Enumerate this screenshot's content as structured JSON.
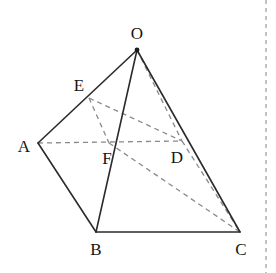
{
  "figure": {
    "background_color": "#ffffff",
    "solid_stroke_color": "#2b2b2b",
    "dashed_stroke_color": "#8a8a8a",
    "label_color": "#141414"
  },
  "vertices": [
    {
      "name": "O",
      "label": "O",
      "x": 137,
      "y": 50,
      "label_x": 137,
      "label_y": 33,
      "dot": true
    },
    {
      "name": "E",
      "label": "E",
      "x": 89,
      "y": 98,
      "label_x": 79,
      "label_y": 85,
      "dot": false
    },
    {
      "name": "A",
      "label": "A",
      "x": 38,
      "y": 143,
      "label_x": 24,
      "label_y": 146,
      "dot": false
    },
    {
      "name": "F",
      "label": "F",
      "x": 109,
      "y": 143,
      "label_x": 107,
      "label_y": 158,
      "dot": false
    },
    {
      "name": "D",
      "label": "D",
      "x": 182,
      "y": 141,
      "label_x": 177,
      "label_y": 157,
      "dot": false
    },
    {
      "name": "B",
      "label": "B",
      "x": 96,
      "y": 232,
      "label_x": 96,
      "label_y": 249,
      "dot": false
    },
    {
      "name": "C",
      "label": "C",
      "x": 240,
      "y": 232,
      "label_x": 241,
      "label_y": 249,
      "dot": false
    }
  ],
  "edges_solid": [
    {
      "name": "edge-O-A",
      "from": "O",
      "to": "A"
    },
    {
      "name": "edge-O-B",
      "from": "O",
      "to": "B"
    },
    {
      "name": "edge-O-C",
      "from": "O",
      "to": "C"
    },
    {
      "name": "edge-A-B",
      "from": "A",
      "to": "B"
    },
    {
      "name": "edge-B-C",
      "from": "B",
      "to": "C"
    }
  ],
  "edges_dashed": [
    {
      "name": "edge-A-D",
      "from": "A",
      "to": "D"
    },
    {
      "name": "edge-O-D",
      "from": "O",
      "to": "D"
    },
    {
      "name": "edge-D-C",
      "from": "D",
      "to": "C"
    },
    {
      "name": "edge-E-D",
      "from": "E",
      "to": "D"
    },
    {
      "name": "edge-E-F",
      "from": "E",
      "to": "F"
    },
    {
      "name": "edge-F-C",
      "from": "F",
      "to": "C"
    }
  ],
  "margin_rule": {
    "name": "page-margin-rule",
    "x": 266,
    "y_start": 0,
    "y_end": 273
  }
}
